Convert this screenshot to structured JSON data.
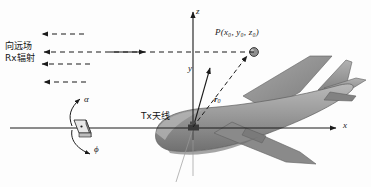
{
  "figure": {
    "background_color": "#fdfdfd",
    "line_color": "#1b1b1b",
    "aircraft_color": "#8e8e8e",
    "aircraft_shadow_color": "#6f6f6f",
    "point_marker_color": "#7a7a7a"
  },
  "axes": {
    "z_label": "z",
    "y_label": "y",
    "x_label": "x",
    "origin_name": "Tx antenna origin"
  },
  "labels": {
    "point_P": "P(x₀, y₀, z₀)",
    "point_P_base": "P",
    "point_P_args": "(x₀, y₀, z₀)",
    "vector_r0": "r₀",
    "vector_r0_base": "r",
    "vector_r0_sub": "0",
    "alpha": "α",
    "phi": "ϕ",
    "tx_antenna": "Tx天线",
    "far_field": "向远场",
    "rx_radiation": "Rx辐射"
  },
  "far_field_arrows": {
    "count": 4,
    "direction": "left",
    "style": "dashed",
    "rows_y": [
      34,
      47,
      59,
      77
    ],
    "lengths_px": [
      40,
      165,
      50,
      40
    ]
  },
  "angle_markers": {
    "alpha_arrow_direction": "up-right",
    "phi_arrow_direction": "down-right",
    "patch_antenna_icon": "patch-antenna-icon"
  }
}
